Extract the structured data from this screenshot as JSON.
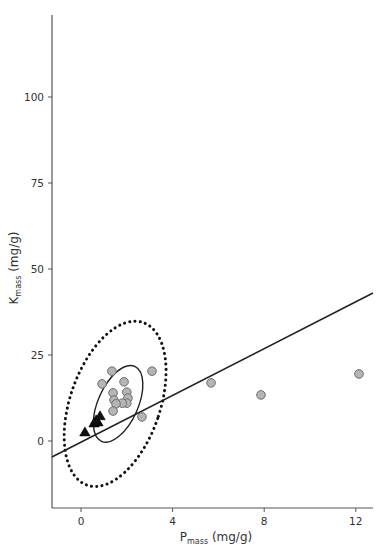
{
  "chart_data": {
    "type": "scatter",
    "title": "",
    "xlabel": {
      "main": "P",
      "sub": "mass",
      "unit": " (mg/g)"
    },
    "ylabel": {
      "main": "K",
      "sub": "mass",
      "unit": " (mg/g)"
    },
    "xlim": [
      -1.27,
      12.75
    ],
    "ylim": [
      -18.8,
      124.4
    ],
    "xticks": [
      0,
      4,
      8,
      12
    ],
    "yticks": [
      0,
      25,
      50,
      75,
      100
    ],
    "grid": false,
    "legend": null,
    "series": [
      {
        "name": "circles",
        "marker": "circle",
        "color": "#b5b5b5",
        "points": [
          {
            "x": 1.35,
            "y": 20.3
          },
          {
            "x": 3.1,
            "y": 20.3
          },
          {
            "x": 0.92,
            "y": 16.6
          },
          {
            "x": 1.88,
            "y": 17.2
          },
          {
            "x": 1.4,
            "y": 14.0
          },
          {
            "x": 2.0,
            "y": 14.2
          },
          {
            "x": 1.44,
            "y": 11.9
          },
          {
            "x": 2.05,
            "y": 12.5
          },
          {
            "x": 2.0,
            "y": 11.0
          },
          {
            "x": 1.8,
            "y": 11.0
          },
          {
            "x": 1.53,
            "y": 10.8
          },
          {
            "x": 1.4,
            "y": 8.7
          },
          {
            "x": 2.66,
            "y": 7.0
          },
          {
            "x": 5.68,
            "y": 16.9
          },
          {
            "x": 7.86,
            "y": 13.4
          },
          {
            "x": 12.14,
            "y": 19.5
          }
        ]
      },
      {
        "name": "triangles",
        "marker": "triangle",
        "color": "#111111",
        "points": [
          {
            "x": 0.17,
            "y": 2.6
          },
          {
            "x": 0.57,
            "y": 5.2
          },
          {
            "x": 0.74,
            "y": 5.5
          },
          {
            "x": 0.66,
            "y": 6.1
          },
          {
            "x": 0.83,
            "y": 7.3
          }
        ]
      }
    ],
    "regression_line": {
      "x1": -1.27,
      "y1": -4.65,
      "x2": 12.75,
      "y2": 43.0
    },
    "ellipses": [
      {
        "name": "inner-confidence-ellipse",
        "style": "solid",
        "cx": 1.62,
        "cy": 10.8,
        "rx_px": 20,
        "ry_px": 41,
        "rotate_deg": 24
      },
      {
        "name": "outer-confidence-ellipse",
        "style": "dotted",
        "cx": 1.49,
        "cy": 10.8,
        "rx_px": 45,
        "ry_px": 86,
        "rotate_deg": 19
      }
    ]
  },
  "layout": {
    "plot_px": {
      "x0": 52,
      "x1": 373,
      "y_axis_top": 15,
      "y_axis_bottom": 508,
      "x_axis_y": 508
    },
    "x_map": {
      "x0_px": 81,
      "px_per_unit": 22.9
    },
    "y_map": {
      "y0_px": 441,
      "px_per_unit": 3.44
    }
  }
}
